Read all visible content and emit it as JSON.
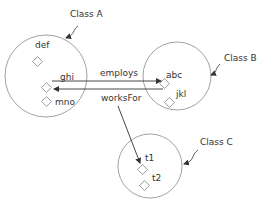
{
  "colors": {
    "stroke": "#8a8a8a",
    "arrow": "#333333",
    "text": "#333333",
    "background": "#ffffff"
  },
  "classes": [
    {
      "id": "A",
      "label": "Class A",
      "members": [
        "def",
        "ghi",
        "mno"
      ]
    },
    {
      "id": "B",
      "label": "Class B",
      "members": [
        "abc",
        "jkl"
      ]
    },
    {
      "id": "C",
      "label": "Class C",
      "members": [
        "t1",
        "t2"
      ]
    }
  ],
  "relations": [
    {
      "label": "employs",
      "from": "ghi",
      "to": "abc"
    },
    {
      "label": "worksFor",
      "from": "abc",
      "to": "ghi"
    },
    {
      "label": "worksFor",
      "from": "worksFor-label",
      "to": "t1"
    }
  ]
}
